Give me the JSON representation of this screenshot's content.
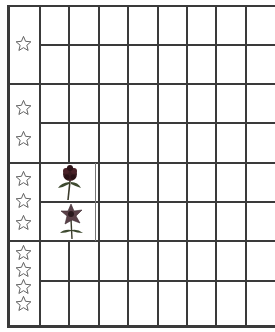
{
  "worksheet": {
    "type": "picture-graph-grid",
    "line_color": "#3a3a3a",
    "star_color": "#555555",
    "columns": 8,
    "rows": [
      {
        "group": 1,
        "stars": 1,
        "subrows": 2,
        "picture": null
      },
      {
        "group": 2,
        "stars": 2,
        "subrows": 2,
        "picture": null
      },
      {
        "group": 3,
        "stars": 3,
        "subrows": 2,
        "picture": "flowers",
        "flowers": [
          "dark-red-flower",
          "star-shaped-flower"
        ]
      },
      {
        "group": 4,
        "stars": 4,
        "subrows": 2,
        "picture": null
      }
    ],
    "icons": {
      "row_label": "star-outline-icon",
      "flower_1": "dark-flower-icon",
      "flower_2": "star-flower-icon"
    }
  }
}
